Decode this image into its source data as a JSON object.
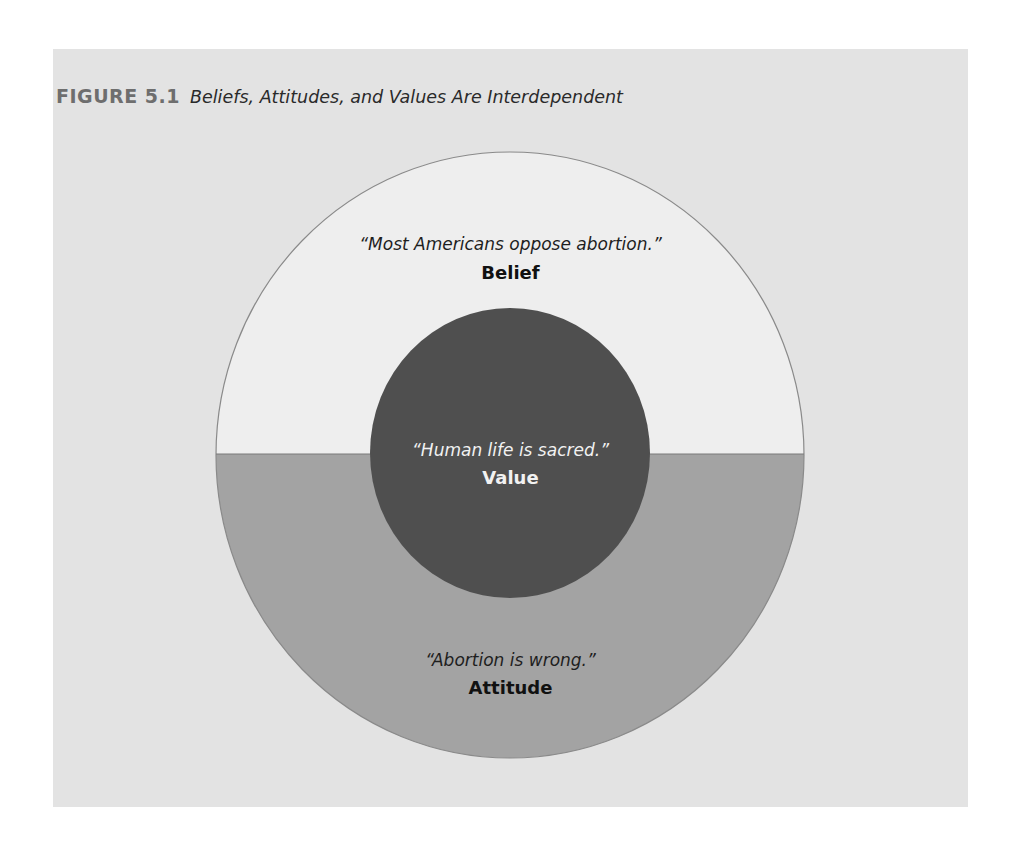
{
  "figure": {
    "number": "FIGURE 5.1",
    "caption": "Beliefs, Attitudes, and Values Are Interdependent"
  },
  "diagram": {
    "outer_upper": {
      "quote": "“Most Americans oppose abortion.”",
      "term": "Belief",
      "fill": "#eeeeee"
    },
    "outer_lower": {
      "quote": "“Abortion is wrong.”",
      "term": "Attitude",
      "fill": "#a3a3a3"
    },
    "inner": {
      "quote": "“Human life is sacred.”",
      "term": "Value",
      "fill": "#4f4f4f"
    },
    "panel_color": "#e3e3e3",
    "stroke_color": "#8a8a8a"
  }
}
